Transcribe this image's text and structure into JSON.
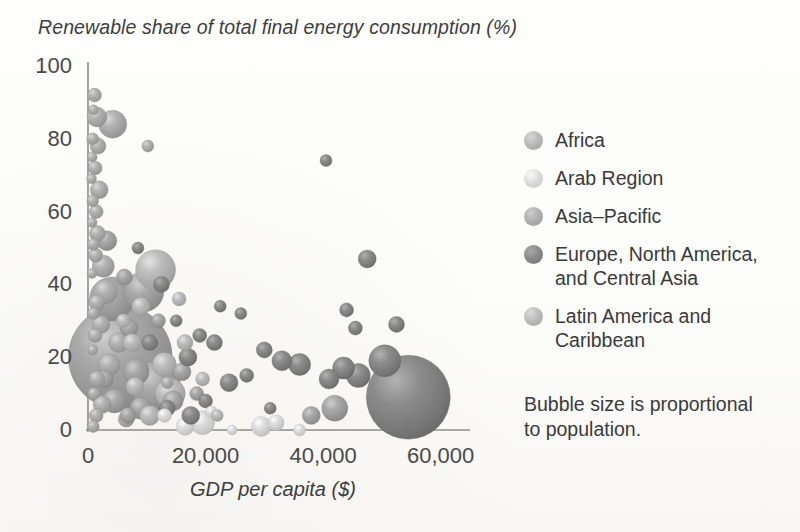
{
  "chart_data": {
    "type": "scatter",
    "title": "Renewable share of total final energy consumption (%)",
    "xlabel": "GDP per capita ($)",
    "ylabel": "Renewable share of total final energy consumption (%)",
    "xlim": [
      0,
      65000
    ],
    "ylim": [
      -5,
      100
    ],
    "xticks": [
      "0",
      "20,000",
      "40,000",
      "60,000"
    ],
    "xtick_values": [
      0,
      20000,
      40000,
      60000
    ],
    "yticks": [
      "0",
      "20",
      "40",
      "60",
      "80",
      "100"
    ],
    "ytick_values": [
      0,
      20,
      40,
      60,
      80,
      100
    ],
    "grid": false,
    "legend_position": "right",
    "size_note": "Bubble size is proportional to population.",
    "series": [
      {
        "name": "Africa",
        "color": "#b2b2b2",
        "points": [
          {
            "x": 1100,
            "y": 92,
            "r": 7
          },
          {
            "x": 900,
            "y": 88,
            "r": 5
          },
          {
            "x": 1500,
            "y": 86,
            "r": 10
          },
          {
            "x": 4200,
            "y": 84,
            "r": 14
          },
          {
            "x": 800,
            "y": 80,
            "r": 6
          },
          {
            "x": 1700,
            "y": 78,
            "r": 8
          },
          {
            "x": 10200,
            "y": 78,
            "r": 6
          },
          {
            "x": 700,
            "y": 75,
            "r": 5
          },
          {
            "x": 1200,
            "y": 72,
            "r": 7
          },
          {
            "x": 600,
            "y": 69,
            "r": 5
          },
          {
            "x": 1900,
            "y": 66,
            "r": 9
          },
          {
            "x": 800,
            "y": 63,
            "r": 6
          },
          {
            "x": 1400,
            "y": 60,
            "r": 7
          },
          {
            "x": 700,
            "y": 57,
            "r": 5
          },
          {
            "x": 1600,
            "y": 54,
            "r": 8
          },
          {
            "x": 900,
            "y": 51,
            "r": 6
          },
          {
            "x": 1300,
            "y": 48,
            "r": 7
          },
          {
            "x": 2600,
            "y": 45,
            "r": 11
          },
          {
            "x": 700,
            "y": 43,
            "r": 5
          },
          {
            "x": 3000,
            "y": 38,
            "r": 12
          },
          {
            "x": 1500,
            "y": 35,
            "r": 8
          },
          {
            "x": 900,
            "y": 32,
            "r": 6
          },
          {
            "x": 2200,
            "y": 29,
            "r": 9
          },
          {
            "x": 1200,
            "y": 26,
            "r": 7
          },
          {
            "x": 5200,
            "y": 24,
            "r": 10
          },
          {
            "x": 800,
            "y": 22,
            "r": 5
          },
          {
            "x": 3600,
            "y": 18,
            "r": 11
          },
          {
            "x": 1500,
            "y": 14,
            "r": 8
          },
          {
            "x": 1000,
            "y": 10,
            "r": 6
          },
          {
            "x": 2400,
            "y": 7,
            "r": 9
          },
          {
            "x": 1400,
            "y": 4,
            "r": 7
          },
          {
            "x": 6500,
            "y": 3,
            "r": 8
          },
          {
            "x": 900,
            "y": 1,
            "r": 6
          },
          {
            "x": 13500,
            "y": 13,
            "r": 6
          }
        ]
      },
      {
        "name": "Arab Region",
        "color": "#dedede",
        "points": [
          {
            "x": 16500,
            "y": 1,
            "r": 9
          },
          {
            "x": 19500,
            "y": 2,
            "r": 12
          },
          {
            "x": 24500,
            "y": 0,
            "r": 5
          },
          {
            "x": 29500,
            "y": 1,
            "r": 10
          },
          {
            "x": 32000,
            "y": 2,
            "r": 8
          },
          {
            "x": 13000,
            "y": 4,
            "r": 7
          },
          {
            "x": 36000,
            "y": 0,
            "r": 6
          },
          {
            "x": 21000,
            "y": 5,
            "r": 6
          }
        ]
      },
      {
        "name": "Asia-Pacific",
        "color": "#a8a8a8",
        "points": [
          {
            "x": 5500,
            "y": 20,
            "r": 52
          },
          {
            "x": 4000,
            "y": 36,
            "r": 22
          },
          {
            "x": 9500,
            "y": 38,
            "r": 20
          },
          {
            "x": 11500,
            "y": 12,
            "r": 25
          },
          {
            "x": 8200,
            "y": 16,
            "r": 13
          },
          {
            "x": 3200,
            "y": 52,
            "r": 10
          },
          {
            "x": 7000,
            "y": 28,
            "r": 9
          },
          {
            "x": 6200,
            "y": 42,
            "r": 8
          },
          {
            "x": 9000,
            "y": 6,
            "r": 11
          },
          {
            "x": 14500,
            "y": 8,
            "r": 10
          },
          {
            "x": 12000,
            "y": 30,
            "r": 7
          },
          {
            "x": 16000,
            "y": 16,
            "r": 9
          },
          {
            "x": 4500,
            "y": 8,
            "r": 12
          },
          {
            "x": 2800,
            "y": 14,
            "r": 9
          },
          {
            "x": 18500,
            "y": 10,
            "r": 7
          },
          {
            "x": 42000,
            "y": 6,
            "r": 13
          },
          {
            "x": 38000,
            "y": 4,
            "r": 9
          },
          {
            "x": 6800,
            "y": 4,
            "r": 8
          }
        ]
      },
      {
        "name": "Europe, North America, and Central Asia",
        "color": "#8c8c8c",
        "points": [
          {
            "x": 54500,
            "y": 9,
            "r": 42
          },
          {
            "x": 50500,
            "y": 19,
            "r": 16
          },
          {
            "x": 46000,
            "y": 15,
            "r": 12
          },
          {
            "x": 43500,
            "y": 17,
            "r": 11
          },
          {
            "x": 41000,
            "y": 14,
            "r": 10
          },
          {
            "x": 47500,
            "y": 47,
            "r": 9
          },
          {
            "x": 40500,
            "y": 74,
            "r": 6
          },
          {
            "x": 52500,
            "y": 29,
            "r": 8
          },
          {
            "x": 36000,
            "y": 18,
            "r": 11
          },
          {
            "x": 33000,
            "y": 19,
            "r": 10
          },
          {
            "x": 30000,
            "y": 22,
            "r": 8
          },
          {
            "x": 27000,
            "y": 15,
            "r": 7
          },
          {
            "x": 24000,
            "y": 13,
            "r": 9
          },
          {
            "x": 21500,
            "y": 24,
            "r": 8
          },
          {
            "x": 19000,
            "y": 26,
            "r": 7
          },
          {
            "x": 17000,
            "y": 20,
            "r": 9
          },
          {
            "x": 15000,
            "y": 30,
            "r": 6
          },
          {
            "x": 22500,
            "y": 34,
            "r": 6
          },
          {
            "x": 26000,
            "y": 32,
            "r": 6
          },
          {
            "x": 12500,
            "y": 40,
            "r": 8
          },
          {
            "x": 10500,
            "y": 24,
            "r": 8
          },
          {
            "x": 8500,
            "y": 50,
            "r": 6
          },
          {
            "x": 20000,
            "y": 8,
            "r": 7
          },
          {
            "x": 31000,
            "y": 6,
            "r": 6
          },
          {
            "x": 44000,
            "y": 33,
            "r": 7
          },
          {
            "x": 45500,
            "y": 28,
            "r": 7
          },
          {
            "x": 13500,
            "y": 6,
            "r": 8
          },
          {
            "x": 17500,
            "y": 4,
            "r": 9
          }
        ]
      },
      {
        "name": "Latin America and Caribbean",
        "color": "#bdbdbd",
        "points": [
          {
            "x": 11500,
            "y": 44,
            "r": 20
          },
          {
            "x": 14000,
            "y": 10,
            "r": 15
          },
          {
            "x": 9000,
            "y": 34,
            "r": 9
          },
          {
            "x": 16500,
            "y": 24,
            "r": 8
          },
          {
            "x": 13000,
            "y": 18,
            "r": 12
          },
          {
            "x": 7500,
            "y": 24,
            "r": 9
          },
          {
            "x": 19500,
            "y": 14,
            "r": 7
          },
          {
            "x": 10500,
            "y": 4,
            "r": 10
          },
          {
            "x": 15500,
            "y": 36,
            "r": 7
          },
          {
            "x": 8000,
            "y": 12,
            "r": 9
          },
          {
            "x": 22000,
            "y": 4,
            "r": 6
          },
          {
            "x": 6000,
            "y": 30,
            "r": 7
          }
        ]
      }
    ]
  },
  "legend": {
    "items": [
      {
        "label": "Africa",
        "color": "#b9b9b9"
      },
      {
        "label": "Arab Region",
        "color": "#dcdcdc"
      },
      {
        "label": "Asia–Pacific",
        "color": "#b0b0b0"
      },
      {
        "label": "Europe, North America, and Central Asia",
        "color": "#8a8a8a"
      },
      {
        "label": "Latin America and Caribbean",
        "color": "#bcbcbc"
      }
    ],
    "note": "Bubble size is proportional to population."
  }
}
